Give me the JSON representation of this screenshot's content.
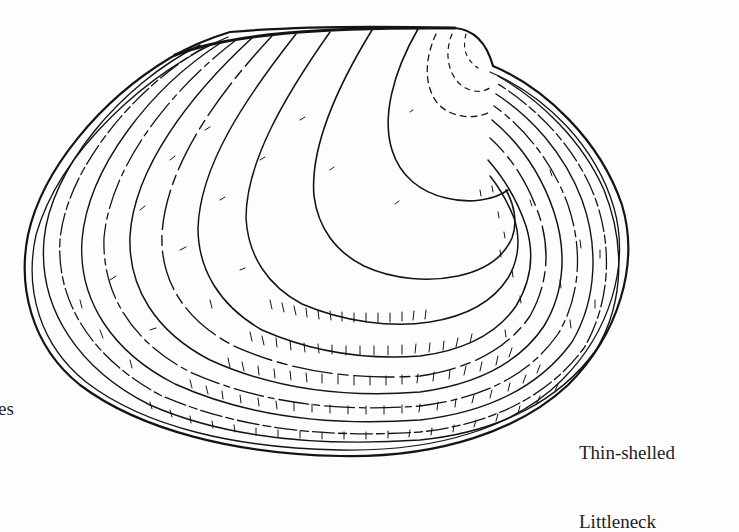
{
  "illustration": {
    "subject": "clam shell line drawing",
    "stroke_color": "#141414",
    "background_color": "#fdfdfd"
  },
  "captions": {
    "right": {
      "line1": "Thin-shelled",
      "line2": "Littleneck"
    },
    "left_fragment": "es"
  }
}
